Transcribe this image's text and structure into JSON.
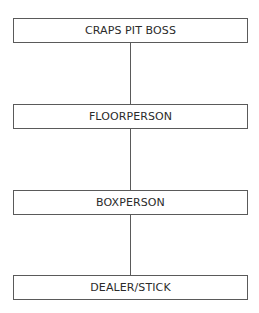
{
  "diagram": {
    "type": "org-chart-hierarchy",
    "direction": "top-to-bottom",
    "nodes": [
      {
        "id": "n1",
        "label": "CRAPS PIT BOSS"
      },
      {
        "id": "n2",
        "label": "FLOORPERSON"
      },
      {
        "id": "n3",
        "label": "BOXPERSON"
      },
      {
        "id": "n4",
        "label": "DEALER/STICK"
      }
    ],
    "edges": [
      {
        "from": "n1",
        "to": "n2"
      },
      {
        "from": "n2",
        "to": "n3"
      },
      {
        "from": "n3",
        "to": "n4"
      }
    ],
    "colors": {
      "line": "#5a5a5a",
      "text": "#2b2b2b",
      "background": "#ffffff"
    }
  }
}
